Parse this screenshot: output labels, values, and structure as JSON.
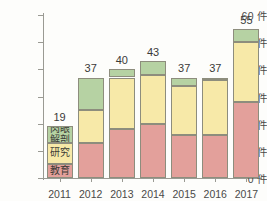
{
  "chart_data": {
    "type": "bar",
    "stacked": true,
    "title": "",
    "subtitle": "",
    "xlabel": "",
    "ylabel": "",
    "categories": [
      "2011",
      "2012",
      "2013",
      "2014",
      "2015",
      "2016",
      "2017"
    ],
    "ylim": [
      0,
      60
    ],
    "ytick_values": [
      0,
      10,
      20,
      30,
      40,
      50,
      60
    ],
    "ytick_labels": [
      "0 件",
      "10 件",
      "20 件",
      "30 件",
      "40 件",
      "50 件",
      "60 件"
    ],
    "unit_suffix": "件",
    "grid": false,
    "legend_position": "inside-first-bar",
    "series": [
      {
        "name": "教育",
        "color": "#e3a09b",
        "values": [
          5,
          13,
          18,
          20,
          16,
          16,
          28
        ]
      },
      {
        "name": "研究",
        "color": "#f7e9a8",
        "values": [
          8,
          12,
          19,
          18,
          18,
          20,
          22
        ]
      },
      {
        "name": "肉眼解剖",
        "color": "#b6d2a3",
        "values": [
          6,
          12,
          3,
          5,
          3,
          1,
          5
        ]
      }
    ],
    "totals": [
      19,
      37,
      40,
      43,
      37,
      37,
      55
    ],
    "total_labels": [
      "19",
      "37",
      "40",
      "43",
      "37",
      "37",
      "55"
    ],
    "legend_labels_in_bar": [
      "肉眼\n解剖",
      "研究",
      "教育"
    ]
  },
  "axis_color": "#9a9a93",
  "bar_border_color": "#8d8d7d",
  "text_color": "#4a4a48",
  "background": "#fdfdfb"
}
